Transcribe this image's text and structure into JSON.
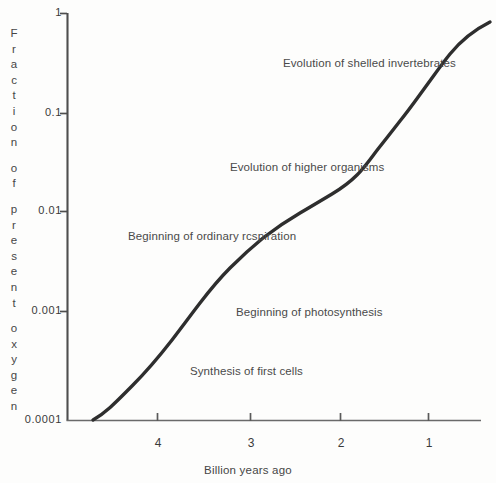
{
  "chart_data": {
    "type": "line",
    "title": "",
    "subtitle": "",
    "xlabel": "Billion years ago",
    "ylabel": "Fraction of present oxygen",
    "yscale": "log",
    "ylim": [
      0.0001,
      1
    ],
    "xlim": [
      4.7,
      0.45
    ],
    "x_inverted": true,
    "grid": false,
    "legend": null,
    "ytick_labels": [
      "1",
      "0.1",
      "0.01",
      "0.001",
      "0.0001"
    ],
    "ytick_values": [
      1,
      0.1,
      0.01,
      0.001,
      0.0001
    ],
    "xtick_labels": [
      "4",
      "3",
      "2",
      "1"
    ],
    "xtick_values": [
      4,
      3,
      2,
      1
    ],
    "series": [
      {
        "name": "Atmospheric oxygen",
        "x": [
          4.42,
          4.2,
          4.0,
          3.8,
          3.6,
          3.4,
          3.2,
          3.0,
          2.8,
          2.6,
          2.4,
          2.2,
          2.0,
          1.8,
          1.6,
          1.4,
          1.2,
          1.0,
          0.8,
          0.6,
          0.48
        ],
        "y": [
          0.0001,
          0.00016,
          0.00026,
          0.00042,
          0.00068,
          0.0012,
          0.0021,
          0.0037,
          0.0056,
          0.0072,
          0.0092,
          0.0125,
          0.018,
          0.028,
          0.042,
          0.062,
          0.097,
          0.16,
          0.28,
          0.55,
          0.85
        ]
      }
    ],
    "annotations": [
      {
        "label": "Evolution of shelled invertebrates",
        "x_px": 283,
        "y_px": 58
      },
      {
        "label": "Evolution of higher organisms",
        "x_px": 230,
        "y_px": 162
      },
      {
        "label": "Beginning of ordinary rcspiration",
        "x_px": 128,
        "y_px": 231
      },
      {
        "label": "Beginning of photosynthesis",
        "x_px": 236,
        "y_px": 307
      },
      {
        "label": "Synthesis of first cells",
        "x_px": 190,
        "y_px": 366
      }
    ],
    "colors": {
      "curve": "#2e2e2e",
      "axis": "#4e4e4e",
      "text": "#454545",
      "background": "#fdfdfc"
    }
  },
  "yaxis_title_letters": [
    "F",
    "r",
    "a",
    "c",
    "t",
    "i",
    "o",
    "n",
    "",
    "o",
    "f",
    "",
    "p",
    "r",
    "e",
    "s",
    "e",
    "n",
    "t",
    "",
    "o",
    "x",
    "y",
    "g",
    "e",
    "n"
  ]
}
